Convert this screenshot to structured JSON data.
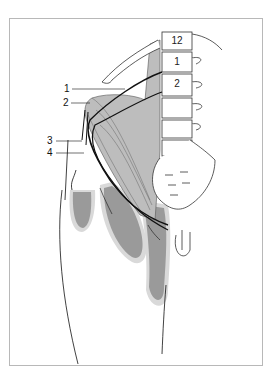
{
  "figure": {
    "type": "anatomical-diagram",
    "vertebra_labels": [
      "12",
      "1",
      "2"
    ],
    "callout_labels": [
      "1",
      "2",
      "3",
      "4"
    ],
    "colors": {
      "muscle": "#bdbdbd",
      "territory_dark": "#9a9a9a",
      "territory_halo": "#d9d9d9",
      "line": "#222222",
      "frame": "#b8b8b8"
    }
  }
}
